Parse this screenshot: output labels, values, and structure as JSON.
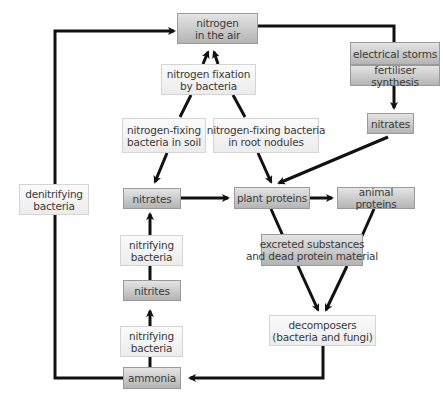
{
  "diagram": {
    "nodes": {
      "air": "nitrogen\nin the air",
      "fixation": "nitrogen fixation\nby bacteria",
      "soil_bacteria": "nitrogen-fixing\nbacteria in soil",
      "nodule_bacteria": "nitrogen-fixing bacteria\nin root nodules",
      "storms": "electrical storms",
      "fertiliser": "fertiliser synthesis",
      "nitrates_right": "nitrates",
      "denitrifying": "denitrifying\nbacteria",
      "nitrates_left": "nitrates",
      "plant_proteins": "plant proteins",
      "animal_proteins": "animal proteins",
      "nitrifying_upper": "nitrifying\nbacteria",
      "excreted": "excreted substances\nand dead protein material",
      "nitrites": "nitrites",
      "nitrifying_lower": "nitrifying\nbacteria",
      "decomposers": "decomposers\n(bacteria and fungi)",
      "ammonia": "ammonia"
    },
    "edges": [
      {
        "from": "ammonia",
        "to": "air",
        "via": "denitrifying"
      },
      {
        "from": "air",
        "to": "soil_bacteria",
        "via": "fixation"
      },
      {
        "from": "air",
        "to": "nodule_bacteria",
        "via": "fixation"
      },
      {
        "from": "air",
        "to": "nitrates_right",
        "via": "storms/fertiliser"
      },
      {
        "from": "soil_bacteria",
        "to": "nitrates_left"
      },
      {
        "from": "nodule_bacteria",
        "to": "plant_proteins"
      },
      {
        "from": "nitrates_right",
        "to": "plant_proteins"
      },
      {
        "from": "nitrates_left",
        "to": "plant_proteins"
      },
      {
        "from": "plant_proteins",
        "to": "animal_proteins"
      },
      {
        "from": "plant_proteins",
        "to": "decomposers",
        "via": "excreted"
      },
      {
        "from": "animal_proteins",
        "to": "decomposers",
        "via": "excreted"
      },
      {
        "from": "decomposers",
        "to": "ammonia"
      },
      {
        "from": "ammonia",
        "to": "nitrites",
        "via": "nitrifying_lower"
      },
      {
        "from": "nitrites",
        "to": "nitrates_left",
        "via": "nitrifying_upper"
      }
    ]
  }
}
